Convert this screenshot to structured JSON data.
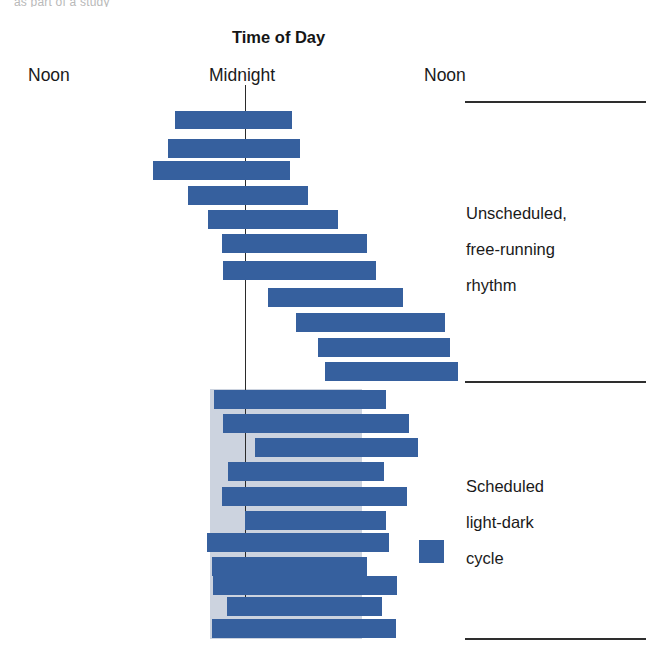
{
  "figure": {
    "top_sliver_text": "as part of a study",
    "title": "Time of Day",
    "axis_labels": [
      {
        "name": "noon-left",
        "text": "Noon",
        "x": 28,
        "y": 65
      },
      {
        "name": "midnight",
        "text": "Midnight",
        "x": 209,
        "y": 65
      },
      {
        "name": "noon-right",
        "text": "Noon",
        "x": 424,
        "y": 65
      }
    ],
    "annotations": [
      {
        "name": "free-running-note",
        "lines": [
          "Unscheduled,",
          "free-running",
          "rhythm"
        ],
        "x": 466,
        "y": 198
      },
      {
        "name": "light-dark-note",
        "lines": [
          "Scheduled",
          "light-dark",
          "cycle"
        ],
        "x": 466,
        "y": 471
      }
    ],
    "separators": [
      {
        "name": "separator-top",
        "x": 465,
        "y": 101,
        "width": 181
      },
      {
        "name": "separator-middle",
        "x": 465,
        "y": 381,
        "width": 181
      },
      {
        "name": "separator-bottom",
        "x": 465,
        "y": 638,
        "width": 181
      }
    ],
    "legend": {
      "swatch_label": "activity-swatch",
      "x": 419,
      "y": 540,
      "width": 25,
      "height": 23,
      "color": "#36609e"
    }
  },
  "chart_data": {
    "type": "bar",
    "subtype": "actogram",
    "title": "Time of Day",
    "xlabel": "Time of Day",
    "ylabel": "",
    "x_tick_labels": [
      "Noon",
      "Midnight",
      "Noon"
    ],
    "x_tick_px": [
      28,
      245,
      424
    ],
    "grid": false,
    "legend_position": "right",
    "legend_entries": [
      "Scheduled light-dark cycle"
    ],
    "colors": {
      "activity_bar": "#36609e",
      "dark_period_shading": "#ccd3df",
      "midnight_reference_line": "#2b2b2b",
      "separator_line": "#2e2e2e",
      "background": "#ffffff"
    },
    "annotations": [
      {
        "text": "Unscheduled, free-running rhythm",
        "segment": "upper"
      },
      {
        "text": "Scheduled light-dark cycle",
        "segment": "lower"
      }
    ],
    "midnight_line": {
      "x": 245,
      "y_top": 85,
      "y_bottom": 600
    },
    "dark_period_shading": {
      "x": 210,
      "y": 389,
      "width": 152,
      "height": 250
    },
    "segments": [
      {
        "name": "unscheduled-free-running",
        "rows": 12,
        "description": "Activity onset drifts later each day (free-running period longer than 24 h)"
      },
      {
        "name": "scheduled-light-dark",
        "rows": 13,
        "description": "Activity entrained to the imposed light-dark cycle"
      }
    ],
    "bars": [
      {
        "day": 1,
        "segment": "upper",
        "x": 175,
        "y": 111,
        "width": 117,
        "height": 18
      },
      {
        "day": 2,
        "segment": "upper",
        "x": 168,
        "y": 139,
        "width": 132,
        "height": 19
      },
      {
        "day": 3,
        "segment": "upper",
        "x": 153,
        "y": 161,
        "width": 137,
        "height": 19
      },
      {
        "day": 4,
        "segment": "upper",
        "x": 188,
        "y": 186,
        "width": 120,
        "height": 19
      },
      {
        "day": 5,
        "segment": "upper",
        "x": 208,
        "y": 210,
        "width": 130,
        "height": 19
      },
      {
        "day": 6,
        "segment": "upper",
        "x": 222,
        "y": 234,
        "width": 145,
        "height": 19
      },
      {
        "day": 7,
        "segment": "upper",
        "x": 223,
        "y": 261,
        "width": 153,
        "height": 19
      },
      {
        "day": 8,
        "segment": "upper",
        "x": 268,
        "y": 288,
        "width": 135,
        "height": 19
      },
      {
        "day": 9,
        "segment": "upper",
        "x": 296,
        "y": 313,
        "width": 149,
        "height": 19
      },
      {
        "day": 10,
        "segment": "upper",
        "x": 318,
        "y": 338,
        "width": 132,
        "height": 19
      },
      {
        "day": 11,
        "segment": "upper",
        "x": 325,
        "y": 362,
        "width": 133,
        "height": 19
      },
      {
        "day": 12,
        "segment": "lower",
        "x": 214,
        "y": 390,
        "width": 172,
        "height": 19
      },
      {
        "day": 13,
        "segment": "lower",
        "x": 223,
        "y": 414,
        "width": 186,
        "height": 19
      },
      {
        "day": 14,
        "segment": "lower",
        "x": 255,
        "y": 438,
        "width": 163,
        "height": 19
      },
      {
        "day": 15,
        "segment": "lower",
        "x": 228,
        "y": 462,
        "width": 156,
        "height": 19
      },
      {
        "day": 16,
        "segment": "lower",
        "x": 222,
        "y": 487,
        "width": 185,
        "height": 19
      },
      {
        "day": 17,
        "segment": "lower",
        "x": 245,
        "y": 511,
        "width": 141,
        "height": 19
      },
      {
        "day": 18,
        "segment": "lower",
        "x": 207,
        "y": 533,
        "width": 182,
        "height": 19
      },
      {
        "day": 19,
        "segment": "lower",
        "x": 212,
        "y": 557,
        "width": 155,
        "height": 19
      },
      {
        "day": 20,
        "segment": "lower",
        "x": 213,
        "y": 576,
        "width": 184,
        "height": 19
      },
      {
        "day": 21,
        "segment": "lower",
        "x": 227,
        "y": 597,
        "width": 155,
        "height": 19
      },
      {
        "day": 22,
        "segment": "lower",
        "x": 212,
        "y": 619,
        "width": 184,
        "height": 19
      }
    ]
  }
}
